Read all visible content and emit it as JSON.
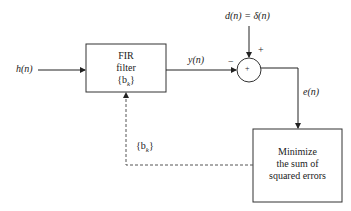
{
  "diagram": {
    "input_label": "h(n)",
    "fir_block": {
      "line1": "FIR",
      "line2": "filter",
      "line3": "{b",
      "line3_sub": "k",
      "line3_end": "}"
    },
    "output_label": "y(n)",
    "desired_label": "d(n) = δ(n)",
    "summer": {
      "symbol": "+",
      "plus_sign": "+",
      "minus_sign": "−"
    },
    "error_label": "e(n)",
    "minimize_block": {
      "line1": "Minimize",
      "line2": "the sum of",
      "line3": "squared errors"
    },
    "feedback_label": "{b",
    "feedback_label_sub": "k",
    "feedback_label_end": "}"
  }
}
